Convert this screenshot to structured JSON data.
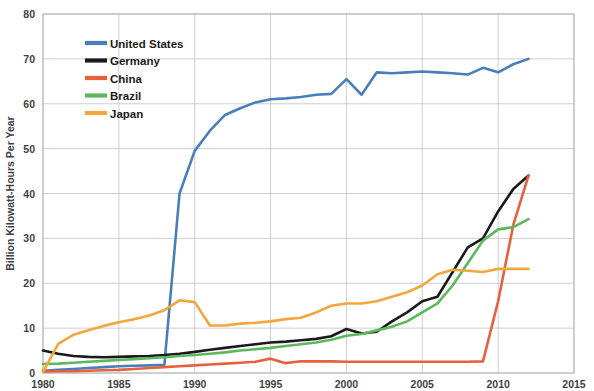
{
  "chart_data": {
    "type": "line",
    "title": "",
    "subtitle": "",
    "xlabel": "",
    "ylabel": "Billion Kilowatt-Hours Per Year",
    "xlim": [
      1980,
      2015
    ],
    "ylim": [
      0,
      80
    ],
    "xticks": [
      1980,
      1985,
      1990,
      1995,
      2000,
      2005,
      2010,
      2015
    ],
    "yticks": [
      0,
      10,
      20,
      30,
      40,
      50,
      60,
      70,
      80
    ],
    "grid": true,
    "legend_position": "top-left-inside",
    "x": [
      1980,
      1981,
      1982,
      1983,
      1984,
      1985,
      1986,
      1987,
      1988,
      1989,
      1990,
      1991,
      1992,
      1993,
      1994,
      1995,
      1996,
      1997,
      1998,
      1999,
      2000,
      2001,
      2002,
      2003,
      2004,
      2005,
      2006,
      2007,
      2008,
      2009,
      2010,
      2011,
      2012
    ],
    "series": [
      {
        "name": "United States",
        "color": "#4a7ebb",
        "values": [
          0.5,
          0.7,
          0.9,
          1.1,
          1.3,
          1.5,
          1.6,
          1.7,
          1.8,
          40.0,
          49.5,
          54.0,
          57.5,
          59.0,
          60.3,
          61.0,
          61.2,
          61.5,
          62.0,
          62.2,
          65.5,
          62.0,
          67.0,
          66.8,
          67.0,
          67.2,
          67.0,
          66.8,
          66.5,
          68.0,
          67.0,
          68.8,
          70.0
        ]
      },
      {
        "name": "Germany",
        "color": "#1a1a1a",
        "values": [
          5.0,
          4.3,
          3.8,
          3.6,
          3.5,
          3.6,
          3.7,
          3.8,
          4.0,
          4.3,
          4.7,
          5.2,
          5.6,
          6.0,
          6.4,
          6.8,
          7.0,
          7.3,
          7.6,
          8.2,
          9.8,
          8.8,
          9.2,
          11.5,
          13.5,
          16.0,
          17.0,
          22.5,
          28.0,
          30.0,
          36.0,
          41.0,
          44.0
        ]
      },
      {
        "name": "China",
        "color": "#e8603c",
        "values": [
          0.3,
          0.4,
          0.4,
          0.5,
          0.6,
          0.7,
          0.9,
          1.1,
          1.3,
          1.5,
          1.7,
          1.9,
          2.1,
          2.3,
          2.5,
          3.2,
          2.2,
          2.6,
          2.6,
          2.6,
          2.5,
          2.5,
          2.5,
          2.5,
          2.5,
          2.5,
          2.5,
          2.5,
          2.5,
          2.6,
          16.0,
          33.0,
          44.0
        ]
      },
      {
        "name": "Brazil",
        "color": "#5cb85c",
        "values": [
          2.0,
          2.1,
          2.3,
          2.5,
          2.7,
          2.9,
          3.1,
          3.3,
          3.5,
          3.8,
          4.0,
          4.3,
          4.6,
          5.0,
          5.3,
          5.6,
          6.0,
          6.4,
          6.8,
          7.4,
          8.3,
          8.7,
          9.5,
          10.3,
          11.5,
          13.5,
          15.5,
          19.5,
          24.5,
          29.5,
          32.0,
          32.5,
          34.3
        ]
      },
      {
        "name": "Japan",
        "color": "#f0a83c",
        "values": [
          0.2,
          6.5,
          8.5,
          9.5,
          10.5,
          11.3,
          12.0,
          12.8,
          14.0,
          16.2,
          15.8,
          10.6,
          10.6,
          11.0,
          11.2,
          11.5,
          12.0,
          12.3,
          13.5,
          15.0,
          15.5,
          15.5,
          16.0,
          17.0,
          18.0,
          19.5,
          22.0,
          23.0,
          22.8,
          22.5,
          23.2,
          23.2,
          23.2
        ]
      }
    ],
    "legend": [
      {
        "label": "United States",
        "color": "#4a7ebb"
      },
      {
        "label": "Germany",
        "color": "#1a1a1a"
      },
      {
        "label": "China",
        "color": "#e8603c"
      },
      {
        "label": "Brazil",
        "color": "#5cb85c"
      },
      {
        "label": "Japan",
        "color": "#f0a83c"
      }
    ]
  }
}
